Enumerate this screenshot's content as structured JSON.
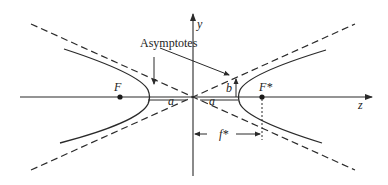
{
  "diagram": {
    "type": "hyperbola",
    "labels": {
      "asymptotes": "Asymptotes",
      "y_axis": "y",
      "z_axis": "z",
      "focus_left": "F",
      "focus_right": "F*",
      "semi_major_left": "a",
      "semi_major_right": "a",
      "semi_minor": "b",
      "focal_distance": "f*"
    },
    "colors": {
      "stroke": "#2a2a2a",
      "background": "#ffffff"
    }
  }
}
